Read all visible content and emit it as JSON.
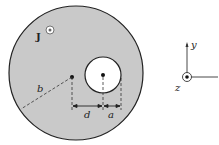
{
  "diagram": {
    "current_density_label": "J",
    "radius_label": "b",
    "offset_label": "d",
    "hole_radius_label": "a",
    "axes": {
      "y_label": "y",
      "z_label": "z"
    },
    "colors": {
      "conductor_fill": "#c9c9c9",
      "outline": "#222222",
      "hole_fill": "#ffffff"
    }
  }
}
